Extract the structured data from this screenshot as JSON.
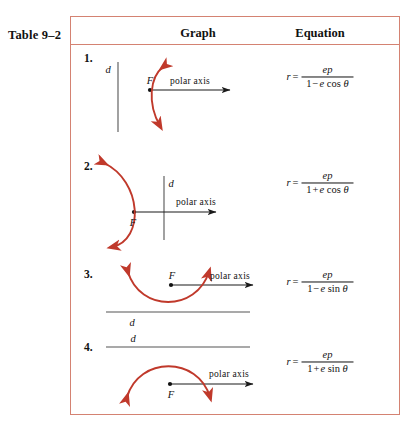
{
  "table": {
    "label": "Table 9–2",
    "columns": [
      {
        "id": "graph",
        "header": "Graph"
      },
      {
        "id": "equation",
        "header": "Equation"
      }
    ],
    "border_color": "#d48272",
    "curve_color": "#c0392b",
    "axis_color": "#1a1a1a",
    "directrix_color": "#555555"
  },
  "rows": [
    {
      "number": "1.",
      "directrix_label": "d",
      "focus_label": "F",
      "axis_label": "polar axis",
      "directrix_orientation": "vertical-left",
      "conic_opening": "right",
      "equation": {
        "variable": "r",
        "equals": "=",
        "numerator": "ep",
        "denominator_one": "1",
        "denominator_operator": "−",
        "denominator_coefficient": "e",
        "denominator_function": "cos",
        "denominator_angle": "θ",
        "plain": "r = ep / (1 − e cos θ)"
      }
    },
    {
      "number": "2.",
      "directrix_label": "d",
      "focus_label": "F",
      "axis_label": "polar axis",
      "directrix_orientation": "vertical-right",
      "conic_opening": "left",
      "equation": {
        "variable": "r",
        "equals": "=",
        "numerator": "ep",
        "denominator_one": "1",
        "denominator_operator": "+",
        "denominator_coefficient": "e",
        "denominator_function": "cos",
        "denominator_angle": "θ",
        "plain": "r = ep / (1 + e cos θ)"
      }
    },
    {
      "number": "3.",
      "directrix_label": "d",
      "focus_label": "F",
      "axis_label": "polar axis",
      "directrix_orientation": "horizontal-below",
      "conic_opening": "up",
      "equation": {
        "variable": "r",
        "equals": "=",
        "numerator": "ep",
        "denominator_one": "1",
        "denominator_operator": "−",
        "denominator_coefficient": "e",
        "denominator_function": "sin",
        "denominator_angle": "θ",
        "plain": "r = ep / (1 − e sin θ)"
      }
    },
    {
      "number": "4.",
      "directrix_label": "d",
      "focus_label": "F",
      "axis_label": "polar axis",
      "directrix_orientation": "horizontal-above",
      "conic_opening": "down",
      "equation": {
        "variable": "r",
        "equals": "=",
        "numerator": "ep",
        "denominator_one": "1",
        "denominator_operator": "+",
        "denominator_coefficient": "e",
        "denominator_function": "sin",
        "denominator_angle": "θ",
        "plain": "r = ep / (1 + e sin θ)"
      }
    }
  ]
}
